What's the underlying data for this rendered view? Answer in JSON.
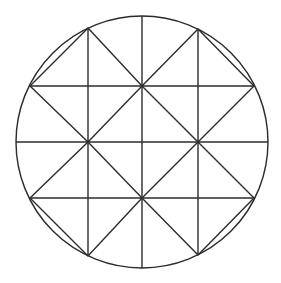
{
  "diagram": {
    "type": "geometric-figure",
    "colors": {
      "stroke": "#2b2b2b",
      "background": "#ffffff"
    },
    "circle": {
      "cx": 142,
      "cy": 142,
      "r": 126
    },
    "vertical_lines": [
      {
        "x": 88,
        "y1": 28,
        "y2": 256
      },
      {
        "x": 142,
        "y1": 16,
        "y2": 268
      },
      {
        "x": 198,
        "y1": 29,
        "y2": 255
      }
    ],
    "horizontal_lines": [
      {
        "y": 86,
        "x1": 30,
        "x2": 254
      },
      {
        "y": 142,
        "x1": 16,
        "x2": 268
      },
      {
        "y": 198,
        "x1": 30,
        "x2": 254
      }
    ],
    "diamonds": [
      {
        "name": "top-left",
        "points": [
          [
            88,
            28
          ],
          [
            142,
            86
          ],
          [
            88,
            142
          ],
          [
            30,
            86
          ]
        ]
      },
      {
        "name": "top-right",
        "points": [
          [
            198,
            29
          ],
          [
            254,
            86
          ],
          [
            198,
            142
          ],
          [
            142,
            86
          ]
        ]
      },
      {
        "name": "bottom-left",
        "points": [
          [
            88,
            142
          ],
          [
            142,
            198
          ],
          [
            88,
            256
          ],
          [
            30,
            198
          ]
        ]
      },
      {
        "name": "bottom-right",
        "points": [
          [
            198,
            142
          ],
          [
            254,
            198
          ],
          [
            198,
            255
          ],
          [
            142,
            198
          ]
        ]
      }
    ]
  }
}
